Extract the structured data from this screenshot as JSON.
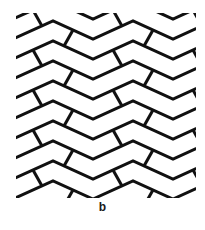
{
  "figure": {
    "panel_label": "b",
    "colors": {
      "line": "#111111",
      "background": "#ffffff"
    },
    "pattern_box": {
      "x": 16,
      "y": 13,
      "width": 180,
      "height": 185
    },
    "geometry": {
      "row_spacing": 20,
      "zigzag_period": 80,
      "zigzag_amplitude": 18,
      "first_row_y": 17,
      "rows": 11,
      "line_width": 3
    }
  }
}
